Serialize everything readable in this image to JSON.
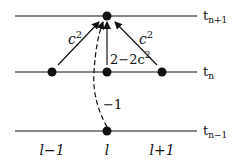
{
  "diagram": {
    "time_levels": [
      {
        "label": "t",
        "sub": "n+1",
        "y": 16
      },
      {
        "label": "t",
        "sub": "n",
        "y": 72
      },
      {
        "label": "t",
        "sub": "n−1",
        "y": 131
      }
    ],
    "space_labels": [
      "l−1",
      "l",
      "l+1"
    ],
    "weights": {
      "left": "c",
      "left_exp": "2",
      "right": "c",
      "right_exp": "2",
      "center": "2−2c",
      "center_exp": "2",
      "past": "−1"
    }
  }
}
